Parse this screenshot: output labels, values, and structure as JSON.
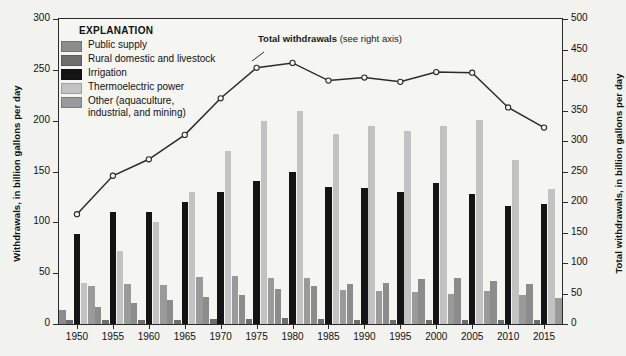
{
  "chart_data": {
    "type": "bar",
    "title": "",
    "categories": [
      "1950",
      "1955",
      "1960",
      "1965",
      "1970",
      "1975",
      "1980",
      "1985",
      "1990",
      "1995",
      "2000",
      "2005",
      "2010",
      "2015"
    ],
    "xlabel": "",
    "ylabel": "Withdrawals, in billion gallons per day",
    "ylim": [
      0,
      300
    ],
    "yticks": [
      0,
      50,
      100,
      150,
      200,
      250,
      300
    ],
    "y2label": "Total withdrawals, in billion gallons per day",
    "y2lim": [
      0,
      500
    ],
    "y2ticks": [
      0,
      50,
      100,
      150,
      200,
      250,
      300,
      350,
      400,
      450,
      500
    ],
    "grid": false,
    "legend_position": "upper-left",
    "series": [
      {
        "name": "Public supply",
        "color": "#8c8c8c",
        "axis": "left",
        "values": [
          14,
          17,
          21,
          24,
          27,
          29,
          34,
          37,
          39,
          40,
          44,
          45,
          42,
          39
        ]
      },
      {
        "name": "Rural domestic and livestock",
        "color": "#6e6e6e",
        "axis": "left",
        "values": [
          4,
          4,
          4,
          4,
          4.5,
          4.5,
          5.5,
          4.5,
          4,
          4,
          4,
          4,
          3.6,
          3.6
        ]
      },
      {
        "name": "Irrigation",
        "color": "#141414",
        "axis": "left",
        "values": [
          89,
          110,
          110,
          120,
          130,
          141,
          150,
          135,
          134,
          130,
          139,
          128,
          116,
          118
        ]
      },
      {
        "name": "Thermoelectric power",
        "color": "#c2c2c2",
        "axis": "left",
        "values": [
          40,
          72,
          100,
          130,
          170,
          200,
          210,
          187,
          195,
          190,
          195,
          201,
          161,
          133
        ]
      },
      {
        "name": "Other (aquaculture, industrial, and mining)",
        "color": "#9a9a9a",
        "axis": "left",
        "values": [
          37,
          39,
          38,
          46,
          47,
          45,
          45,
          33,
          32,
          31,
          30,
          32,
          29,
          26
        ]
      }
    ],
    "line_series": {
      "name": "Total withdrawals",
      "axis": "right",
      "color": "#2b2b2b",
      "marker": "open-circle",
      "annotation_bold": "Total withdrawals",
      "annotation_rest": " (see right axis)",
      "values_right_axis": [
        180,
        243,
        270,
        310,
        370,
        420,
        428,
        399,
        404,
        397,
        413,
        412,
        355,
        322
      ]
    }
  },
  "legend": {
    "title": "EXPLANATION",
    "items": [
      {
        "label": "Public supply",
        "label2": ""
      },
      {
        "label": "Rural domestic and livestock",
        "label2": ""
      },
      {
        "label": "Irrigation",
        "label2": ""
      },
      {
        "label": "Thermoelectric power",
        "label2": ""
      },
      {
        "label": "Other (aquaculture,",
        "label2": "industrial, and mining)"
      }
    ]
  }
}
